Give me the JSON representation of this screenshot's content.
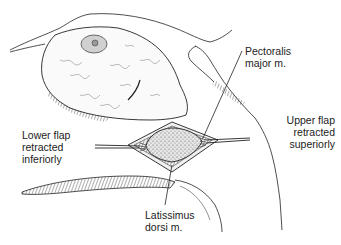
{
  "figure": {
    "colors": {
      "ink": "#222222",
      "background": "#ffffff",
      "muscle_fill": "#d9d9d9"
    }
  },
  "labels": {
    "pectoralis": {
      "line1": "Pectoralis",
      "line2": "major m."
    },
    "lower_flap": {
      "line1": "Lower flap",
      "line2": "retracted",
      "line3": "inferiorly"
    },
    "upper_flap": {
      "line1": "Upper flap",
      "line2": "retracted",
      "line3": "superiorly"
    },
    "latissimus": {
      "line1": "Latissimus",
      "line2": "dorsi m."
    }
  }
}
